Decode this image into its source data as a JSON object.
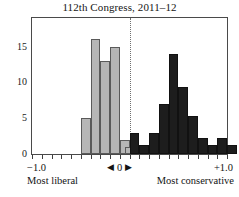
{
  "chart_data": {
    "type": "bar",
    "title": "112th Congress, 2011–12",
    "xlabel": "",
    "ylabel": "",
    "xlim": [
      -1.0,
      1.0
    ],
    "ylim": [
      0,
      19
    ],
    "grid": false,
    "legend": "none",
    "bin_width": 0.1,
    "annotations": {
      "zero_line": 0,
      "left_pole": "Most liberal",
      "right_pole": "Most conservative",
      "center_marker": "◀ 0 ▶"
    },
    "x_tick_labels": [
      "−1.0",
      "◀ 0 ▶",
      "+1.0"
    ],
    "x_tick_values": [
      -1.0,
      0,
      1.0
    ],
    "y_tick_labels": [
      "0",
      "5",
      "10",
      "15"
    ],
    "y_tick_values": [
      0,
      5,
      10,
      15
    ],
    "series": [
      {
        "name": "liberal",
        "color": "#b6b6b6",
        "bins": [
          -0.5,
          -0.4,
          -0.3,
          -0.2,
          -0.1,
          -0.05
        ],
        "values": [
          5,
          16,
          13,
          15,
          2,
          1
        ]
      },
      {
        "name": "conservative",
        "color": "#1d1d1d",
        "bins": [
          0.0,
          0.1,
          0.2,
          0.3,
          0.4,
          0.5,
          0.6,
          0.7,
          0.8,
          0.9,
          1.0
        ],
        "values": [
          3,
          1.3,
          3,
          7,
          14,
          9.3,
          5.3,
          2.3,
          1.3,
          2.3,
          1.3
        ]
      }
    ]
  },
  "axis": {
    "y_ticks": [
      {
        "label": "0",
        "value": 0
      },
      {
        "label": "5",
        "value": 5
      },
      {
        "label": "10",
        "value": 10
      },
      {
        "label": "15",
        "value": 15
      }
    ],
    "x_left_label": "−1.0",
    "x_center_label": "0",
    "x_right_label": "+1.0",
    "x_center_left_arrow": "◀",
    "x_center_right_arrow": "▶",
    "caption_left": "Most liberal",
    "caption_right": "Most conservative"
  }
}
